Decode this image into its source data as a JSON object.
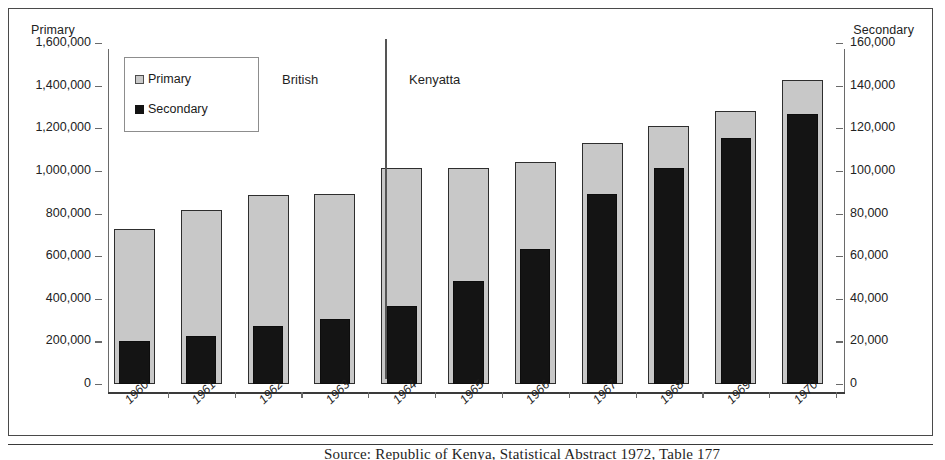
{
  "axes": {
    "left_title": "Primary",
    "right_title": "Secondary",
    "left_ticks": [
      "1,600,000",
      "1,400,000",
      "1,200,000",
      "1,000,000",
      "800,000",
      "600,000",
      "400,000",
      "200,000",
      "0"
    ],
    "right_ticks": [
      "160,000",
      "140,000",
      "120,000",
      "100,000",
      "80,000",
      "60,000",
      "40,000",
      "20,000",
      "0"
    ]
  },
  "legend": {
    "primary_label": "Primary",
    "secondary_label": "Secondary",
    "primary_color": "#c8c8c8",
    "secondary_color": "#141414"
  },
  "annotations": {
    "british": "British",
    "kenyatta": "Kenyatta"
  },
  "caption": {
    "text": "Source: Republic of Kenya, Statistical Abstract 1972, Table 177"
  },
  "chart_data": {
    "type": "bar",
    "title": "",
    "xlabel": "",
    "ylabel": "Primary",
    "y2label": "Secondary",
    "ylim": [
      0,
      1600000
    ],
    "y2lim": [
      0,
      160000
    ],
    "grid": false,
    "legend_position": "top-left",
    "categories": [
      "1960",
      "1961",
      "1962",
      "1963",
      "1964",
      "1965",
      "1966",
      "1967",
      "1968",
      "1969",
      "1970"
    ],
    "series": [
      {
        "name": "Primary",
        "axis": "left",
        "color": "#c8c8c8",
        "values": [
          725000,
          818000,
          885000,
          892000,
          1012000,
          1015000,
          1043000,
          1133000,
          1209000,
          1280000,
          1428000
        ]
      },
      {
        "name": "Secondary",
        "axis": "right",
        "color": "#141414",
        "values": [
          20300,
          22400,
          27000,
          30500,
          36400,
          48500,
          63200,
          89200,
          101500,
          115400,
          126800
        ]
      }
    ],
    "annotations": [
      {
        "label": "British",
        "spans": [
          "1960",
          "1963"
        ]
      },
      {
        "label": "Kenyatta",
        "spans": [
          "1964",
          "1970"
        ]
      }
    ]
  }
}
